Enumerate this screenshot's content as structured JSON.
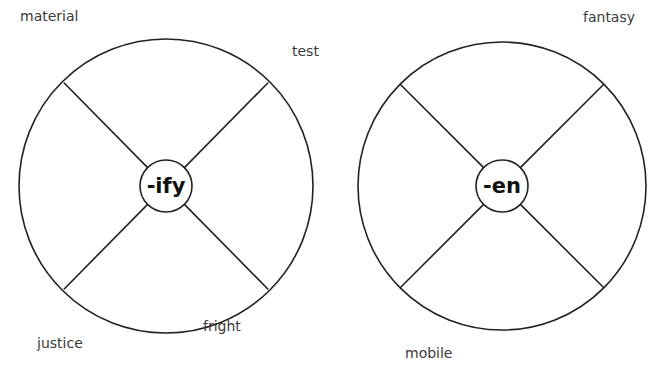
{
  "wheels": [
    {
      "suffix": "-ify",
      "center": [
        166,
        186
      ],
      "radius": 147,
      "hub_radius": 26,
      "words": [
        "material",
        "test",
        "justice",
        "fright"
      ]
    },
    {
      "suffix": "-en",
      "center": [
        502,
        186
      ],
      "radius": 144,
      "hub_radius": 26,
      "words": [
        "fantasy",
        "mobile"
      ]
    }
  ],
  "colors": {
    "stroke": "#222222",
    "text": "#3a3a3a"
  }
}
